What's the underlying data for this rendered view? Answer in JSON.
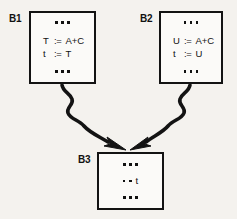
{
  "diagram": {
    "background_color": "#f4f2ee",
    "stroke_color": "#131313",
    "blocks": [
      {
        "id": "b1",
        "label": "B1",
        "lines": [
          {
            "kind": "ellipsis",
            "text": "•••"
          },
          {
            "kind": "assignment",
            "lhs": "T",
            "op": ":=",
            "rhs": "A+C"
          },
          {
            "kind": "assignment",
            "lhs": "t",
            "op": ":=",
            "rhs": "T"
          },
          {
            "kind": "ellipsis",
            "text": "•••"
          }
        ]
      },
      {
        "id": "b2",
        "label": "B2",
        "lines": [
          {
            "kind": "ellipsis",
            "text": "•••"
          },
          {
            "kind": "assignment",
            "lhs": "U",
            "op": ":=",
            "rhs": "A+C"
          },
          {
            "kind": "assignment",
            "lhs": "t",
            "op": ":=",
            "rhs": "U"
          },
          {
            "kind": "ellipsis",
            "text": "•••"
          }
        ]
      },
      {
        "id": "b3",
        "label": "B3",
        "lines": [
          {
            "kind": "ellipsis",
            "text": "•••"
          },
          {
            "kind": "mixed",
            "dots": "••",
            "identifier": "t"
          },
          {
            "kind": "ellipsis",
            "text": "•••"
          }
        ]
      }
    ],
    "edges": [
      {
        "id": "edge-b1-b3",
        "from": "B1",
        "to": "B3",
        "style": "wavy-arrow"
      },
      {
        "id": "edge-b2-b3",
        "from": "B2",
        "to": "B3",
        "style": "wavy-arrow"
      }
    ]
  }
}
